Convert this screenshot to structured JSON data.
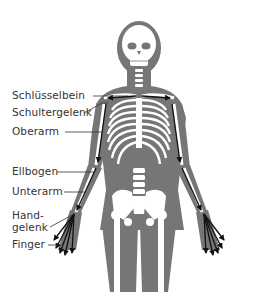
{
  "diagram": {
    "type": "anatomical-skeleton-arm-bones",
    "colors": {
      "body": "#767676",
      "bone": "#ffffff",
      "arrow": "#111111",
      "leader": "#333333",
      "text": "#333333"
    },
    "labels": [
      {
        "id": "schluesselbein",
        "text": "Schlüsselbein"
      },
      {
        "id": "schultergelenk",
        "text": "Schultergelenk"
      },
      {
        "id": "oberarm",
        "text": "Oberarm"
      },
      {
        "id": "ellbogen",
        "text": "Ellbogen"
      },
      {
        "id": "unterarm",
        "text": "Unterarm"
      },
      {
        "id": "handgelenk_line1",
        "text": "Hand-"
      },
      {
        "id": "handgelenk_line2",
        "text": "gelenk"
      },
      {
        "id": "finger",
        "text": "Finger"
      }
    ]
  }
}
